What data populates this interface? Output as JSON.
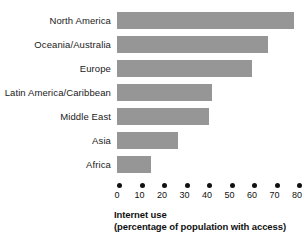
{
  "chart_data": {
    "type": "bar",
    "orientation": "horizontal",
    "title": "",
    "subtitle": "",
    "categories": [
      "North America",
      "Oceania/Australia",
      "Europe",
      "Latin America/Caribbean",
      "Middle East",
      "Asia",
      "Africa"
    ],
    "values": [
      78.5,
      67,
      60,
      42,
      41,
      27,
      15
    ],
    "xlabel": "Internet use (percentage of population with access)",
    "xlabel_lines": [
      "Internet use",
      "(percentage of population with access)"
    ],
    "ylabel": "",
    "xlim": [
      0,
      80
    ],
    "xticks": [
      0,
      10,
      20,
      30,
      40,
      50,
      60,
      70,
      80
    ],
    "xtick_labels": [
      "0",
      "10",
      "20",
      "30",
      "40",
      "50",
      "60",
      "70",
      "80"
    ],
    "grid": false,
    "legend": null,
    "bar_color": "#969696",
    "text_color": "#111111",
    "background": "#ffffff",
    "tick_marker": "filled-circle"
  }
}
